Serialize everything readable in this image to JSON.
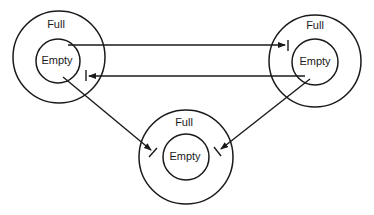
{
  "diagram": {
    "colors": {
      "stroke": "#1a1a1a",
      "background": "#ffffff"
    },
    "nodes": [
      {
        "id": "top-left",
        "outer_label": "Full",
        "inner_label": "Empty"
      },
      {
        "id": "top-right",
        "outer_label": "Full",
        "inner_label": "Empty"
      },
      {
        "id": "bottom",
        "outer_label": "Full",
        "inner_label": "Empty"
      }
    ],
    "edges": [
      {
        "from": "top-left.inner",
        "to": "top-right.outer",
        "end": "arrow-with-bar"
      },
      {
        "from": "top-right.inner",
        "to": "top-left.outer",
        "end": "arrow-with-bar"
      },
      {
        "from": "top-left.inner",
        "to": "bottom.outer",
        "end": "arrow-with-bar"
      },
      {
        "from": "top-right.inner",
        "to": "bottom.outer",
        "end": "arrow-with-bar"
      }
    ]
  }
}
